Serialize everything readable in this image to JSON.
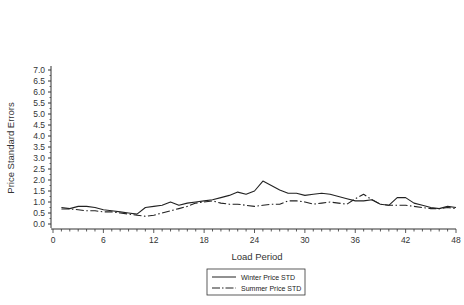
{
  "chart_data": {
    "type": "line",
    "title": "",
    "xlabel": "Load Period",
    "ylabel": "Price Standard Errors",
    "xlim": [
      0,
      48
    ],
    "ylim": [
      0,
      7.0
    ],
    "x_ticks": [
      0,
      6,
      12,
      18,
      24,
      30,
      36,
      42,
      48
    ],
    "y_ticks": [
      "0.0",
      "0.5",
      "1.0",
      "1.5",
      "2.0",
      "2.5",
      "3.0",
      "3.5",
      "4.0",
      "4.5",
      "5.0",
      "5.5",
      "6.0",
      "6.5",
      "7.0"
    ],
    "grid": false,
    "legend_position": "bottom-center",
    "x": [
      1,
      2,
      3,
      4,
      5,
      6,
      7,
      8,
      9,
      10,
      11,
      12,
      13,
      14,
      15,
      16,
      17,
      18,
      19,
      20,
      21,
      22,
      23,
      24,
      25,
      26,
      27,
      28,
      29,
      30,
      31,
      32,
      33,
      34,
      35,
      36,
      37,
      38,
      39,
      40,
      41,
      42,
      43,
      44,
      45,
      46,
      47,
      48
    ],
    "series": [
      {
        "name": "Winter Price STD",
        "style": "solid",
        "values": [
          0.75,
          0.7,
          0.8,
          0.8,
          0.75,
          0.65,
          0.6,
          0.55,
          0.5,
          0.45,
          0.75,
          0.8,
          0.85,
          1.0,
          0.85,
          0.95,
          1.0,
          1.05,
          1.1,
          1.2,
          1.3,
          1.45,
          1.35,
          1.5,
          1.95,
          1.75,
          1.55,
          1.4,
          1.4,
          1.3,
          1.35,
          1.4,
          1.35,
          1.25,
          1.15,
          1.05,
          1.05,
          1.1,
          0.9,
          0.85,
          1.2,
          1.2,
          0.95,
          0.85,
          0.75,
          0.7,
          0.8,
          0.75
        ]
      },
      {
        "name": "Summer Price STD",
        "style": "dash-dot",
        "values": [
          0.68,
          0.68,
          0.65,
          0.6,
          0.6,
          0.55,
          0.55,
          0.5,
          0.45,
          0.4,
          0.35,
          0.4,
          0.5,
          0.6,
          0.7,
          0.8,
          0.95,
          1.0,
          1.05,
          0.95,
          0.9,
          0.9,
          0.85,
          0.8,
          0.85,
          0.9,
          0.9,
          1.05,
          1.05,
          1.0,
          0.9,
          0.95,
          1.0,
          0.95,
          0.9,
          1.15,
          1.35,
          1.1,
          0.9,
          0.85,
          0.85,
          0.85,
          0.8,
          0.75,
          0.7,
          0.7,
          0.75,
          0.7
        ]
      }
    ]
  },
  "legend": {
    "items": [
      {
        "label": "Winter Price STD"
      },
      {
        "label": "Summer Price STD"
      }
    ]
  },
  "axes": {
    "x_title": "Load Period",
    "y_title": "Price Standard Errors"
  }
}
